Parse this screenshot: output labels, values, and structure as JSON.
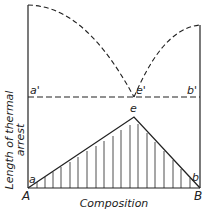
{
  "diagram": {
    "type": "tammann-triangle-eutectic",
    "points": {
      "a_prime": "a'",
      "e_prime": "e'",
      "b_prime": "b'",
      "e": "e",
      "a": "a",
      "b": "b",
      "A": "A",
      "B": "B"
    },
    "axes": {
      "xlabel": "Composition",
      "ylabel_line1": "Length of thermal",
      "ylabel_line2": "arrest"
    },
    "color": "#222222"
  }
}
